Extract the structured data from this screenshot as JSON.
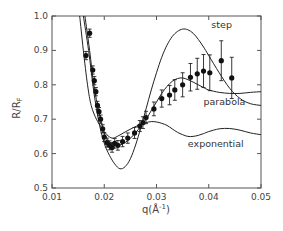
{
  "chart_data": {
    "type": "scatter",
    "title": "",
    "xlabel": "q(Å⁻¹)",
    "ylabel": "R/R_F",
    "xlim": [
      0.01,
      0.05
    ],
    "ylim": [
      0.5,
      1.0
    ],
    "grid": false,
    "x_ticks": [
      0.01,
      0.02,
      0.03,
      0.04,
      0.05
    ],
    "x_tick_labels": [
      "0.01",
      "0.02",
      "0.03",
      "0.04",
      "0.05"
    ],
    "y_ticks": [
      0.5,
      0.6,
      0.7,
      0.8,
      0.9,
      1.0
    ],
    "y_tick_labels": [
      "0.5",
      "0.6",
      "0.7",
      "0.8",
      "0.9",
      "1.0"
    ],
    "measured": {
      "name": "data",
      "points": [
        {
          "q": 0.0165,
          "r": 0.885,
          "err": 0.012
        },
        {
          "q": 0.0172,
          "r": 0.95,
          "err": 0.012
        },
        {
          "q": 0.0178,
          "r": 0.843,
          "err": 0.012
        },
        {
          "q": 0.0181,
          "r": 0.812,
          "err": 0.012
        },
        {
          "q": 0.0184,
          "r": 0.78,
          "err": 0.012
        },
        {
          "q": 0.0187,
          "r": 0.74,
          "err": 0.012
        },
        {
          "q": 0.019,
          "r": 0.722,
          "err": 0.012
        },
        {
          "q": 0.0193,
          "r": 0.7,
          "err": 0.012
        },
        {
          "q": 0.0197,
          "r": 0.672,
          "err": 0.012
        },
        {
          "q": 0.02,
          "r": 0.648,
          "err": 0.013
        },
        {
          "q": 0.0205,
          "r": 0.632,
          "err": 0.013
        },
        {
          "q": 0.021,
          "r": 0.624,
          "err": 0.013
        },
        {
          "q": 0.0215,
          "r": 0.618,
          "err": 0.014
        },
        {
          "q": 0.022,
          "r": 0.63,
          "err": 0.014
        },
        {
          "q": 0.0226,
          "r": 0.624,
          "err": 0.014
        },
        {
          "q": 0.0235,
          "r": 0.635,
          "err": 0.015
        },
        {
          "q": 0.0245,
          "r": 0.645,
          "err": 0.015
        },
        {
          "q": 0.0258,
          "r": 0.66,
          "err": 0.016
        },
        {
          "q": 0.0268,
          "r": 0.68,
          "err": 0.016
        },
        {
          "q": 0.0274,
          "r": 0.69,
          "err": 0.017
        },
        {
          "q": 0.028,
          "r": 0.705,
          "err": 0.018
        },
        {
          "q": 0.0295,
          "r": 0.73,
          "err": 0.02
        },
        {
          "q": 0.031,
          "r": 0.76,
          "err": 0.025
        },
        {
          "q": 0.0325,
          "r": 0.77,
          "err": 0.028
        },
        {
          "q": 0.0335,
          "r": 0.785,
          "err": 0.03
        },
        {
          "q": 0.035,
          "r": 0.8,
          "err": 0.035
        },
        {
          "q": 0.0365,
          "r": 0.822,
          "err": 0.04
        },
        {
          "q": 0.0378,
          "r": 0.832,
          "err": 0.045
        },
        {
          "q": 0.039,
          "r": 0.84,
          "err": 0.048
        },
        {
          "q": 0.0402,
          "r": 0.835,
          "err": 0.052
        },
        {
          "q": 0.0424,
          "r": 0.87,
          "err": 0.058
        },
        {
          "q": 0.0444,
          "r": 0.82,
          "err": 0.06
        }
      ]
    },
    "series": [
      {
        "name": "step",
        "points": [
          [
            0.016,
            1.0
          ],
          [
            0.017,
            0.9
          ],
          [
            0.018,
            0.78
          ],
          [
            0.019,
            0.69
          ],
          [
            0.02,
            0.63
          ],
          [
            0.021,
            0.595
          ],
          [
            0.022,
            0.57
          ],
          [
            0.023,
            0.556
          ],
          [
            0.024,
            0.562
          ],
          [
            0.025,
            0.585
          ],
          [
            0.026,
            0.625
          ],
          [
            0.027,
            0.675
          ],
          [
            0.028,
            0.73
          ],
          [
            0.029,
            0.785
          ],
          [
            0.03,
            0.835
          ],
          [
            0.031,
            0.88
          ],
          [
            0.032,
            0.915
          ],
          [
            0.033,
            0.94
          ],
          [
            0.034,
            0.955
          ],
          [
            0.035,
            0.962
          ],
          [
            0.036,
            0.96
          ],
          [
            0.037,
            0.95
          ],
          [
            0.038,
            0.932
          ],
          [
            0.039,
            0.91
          ],
          [
            0.04,
            0.885
          ],
          [
            0.042,
            0.835
          ],
          [
            0.044,
            0.79
          ],
          [
            0.046,
            0.76
          ],
          [
            0.048,
            0.745
          ],
          [
            0.05,
            0.74
          ]
        ]
      },
      {
        "name": "parabola",
        "points": [
          [
            0.0163,
            1.0
          ],
          [
            0.0172,
            0.9
          ],
          [
            0.018,
            0.8
          ],
          [
            0.019,
            0.72
          ],
          [
            0.02,
            0.66
          ],
          [
            0.021,
            0.635
          ],
          [
            0.022,
            0.625
          ],
          [
            0.023,
            0.625
          ],
          [
            0.024,
            0.632
          ],
          [
            0.025,
            0.645
          ],
          [
            0.026,
            0.66
          ],
          [
            0.027,
            0.68
          ],
          [
            0.028,
            0.7
          ],
          [
            0.029,
            0.725
          ],
          [
            0.03,
            0.75
          ],
          [
            0.031,
            0.775
          ],
          [
            0.032,
            0.795
          ],
          [
            0.033,
            0.81
          ],
          [
            0.034,
            0.818
          ],
          [
            0.035,
            0.82
          ],
          [
            0.036,
            0.815
          ],
          [
            0.037,
            0.808
          ],
          [
            0.038,
            0.8
          ],
          [
            0.039,
            0.792
          ],
          [
            0.04,
            0.785
          ],
          [
            0.042,
            0.778
          ],
          [
            0.044,
            0.775
          ],
          [
            0.046,
            0.775
          ],
          [
            0.048,
            0.778
          ],
          [
            0.05,
            0.78
          ]
        ]
      },
      {
        "name": "exponential",
        "points": [
          [
            0.0153,
            1.0
          ],
          [
            0.016,
            0.9
          ],
          [
            0.0168,
            0.8
          ],
          [
            0.0175,
            0.74
          ],
          [
            0.0185,
            0.7
          ],
          [
            0.0195,
            0.675
          ],
          [
            0.0205,
            0.655
          ],
          [
            0.0215,
            0.645
          ],
          [
            0.0225,
            0.65
          ],
          [
            0.024,
            0.663
          ],
          [
            0.0255,
            0.675
          ],
          [
            0.027,
            0.685
          ],
          [
            0.028,
            0.69
          ],
          [
            0.029,
            0.693
          ],
          [
            0.03,
            0.692
          ],
          [
            0.031,
            0.688
          ],
          [
            0.032,
            0.682
          ],
          [
            0.033,
            0.672
          ],
          [
            0.034,
            0.662
          ],
          [
            0.035,
            0.655
          ],
          [
            0.036,
            0.65
          ],
          [
            0.037,
            0.65
          ],
          [
            0.038,
            0.653
          ],
          [
            0.039,
            0.658
          ],
          [
            0.04,
            0.664
          ],
          [
            0.042,
            0.672
          ],
          [
            0.044,
            0.673
          ],
          [
            0.046,
            0.668
          ],
          [
            0.048,
            0.66
          ],
          [
            0.05,
            0.655
          ]
        ]
      }
    ],
    "annotations": [
      {
        "text": "step",
        "q": 0.0405,
        "r": 0.965
      },
      {
        "text": "parabola",
        "q": 0.039,
        "r": 0.74
      },
      {
        "text": "exponential",
        "q": 0.036,
        "r": 0.62
      }
    ]
  }
}
